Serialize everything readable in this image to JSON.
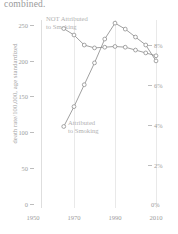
{
  "title": "combined.",
  "axes": {
    "y_left_label": "death rate/100,000, age standardized",
    "y_left_ticks": [
      "250",
      "200",
      "150",
      "100",
      "50",
      "0"
    ],
    "y_right_ticks": [
      "8%",
      "6%",
      "4%",
      "2%",
      "0%"
    ],
    "x_ticks": [
      "1950",
      "1970",
      "1990",
      "2010"
    ]
  },
  "annotations": {
    "not_attributed": "NOT Attributed\nto Smoking",
    "attributed": "Attributed\nto Smoking"
  },
  "chart_data": {
    "type": "line",
    "title": "combined.",
    "xlabel": "",
    "ylabel": "death rate/100,000, age standardized",
    "y2label": "",
    "xlim": [
      1950,
      2012
    ],
    "ylim": [
      0,
      270
    ],
    "y2lim": [
      0,
      9.2
    ],
    "grid": true,
    "legend": "inline-annotations",
    "series": [
      {
        "name": "NOT Attributed to Smoking",
        "axis": "left",
        "units": "death rate/100,000",
        "x": [
          1965,
          1970,
          1975,
          1980,
          1985,
          1990,
          1995,
          2000,
          2005,
          2010
        ],
        "values": [
          245,
          236,
          222,
          218,
          219,
          220,
          219,
          215,
          211,
          207
        ]
      },
      {
        "name": "Attributed to Smoking",
        "axis": "right",
        "units": "percent",
        "x": [
          1965,
          1970,
          1975,
          1980,
          1985,
          1990,
          1995,
          2000,
          2005,
          2010
        ],
        "values": [
          3.9,
          4.9,
          6.0,
          7.1,
          8.3,
          9.1,
          8.8,
          8.4,
          8.0,
          7.2
        ]
      }
    ]
  },
  "colors": {
    "line": "#8f8f8f",
    "grid": "#e9e9e9",
    "text": "#9d9d9d",
    "annotation": "#b2b2b2",
    "background": "#ffffff"
  }
}
